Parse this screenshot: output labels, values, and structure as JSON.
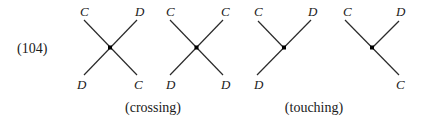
{
  "equation_number": "(104)",
  "captions": {
    "crossing": "(crossing)",
    "touching": "(touching)"
  },
  "diagrams": [
    {
      "type": "crossing",
      "labels": {
        "top_left": "C",
        "top_right": "D",
        "bottom_left": "D",
        "bottom_right": "C"
      }
    },
    {
      "type": "crossing",
      "labels": {
        "top_left": "C",
        "top_right": "C",
        "bottom_left": "D",
        "bottom_right": "D"
      }
    },
    {
      "type": "touching",
      "labels": {
        "top_left": "C",
        "top_right": "D",
        "bottom_left": "D"
      }
    },
    {
      "type": "touching",
      "labels": {
        "top_left": "C",
        "top_right": "D",
        "bottom_right": "C"
      }
    }
  ]
}
